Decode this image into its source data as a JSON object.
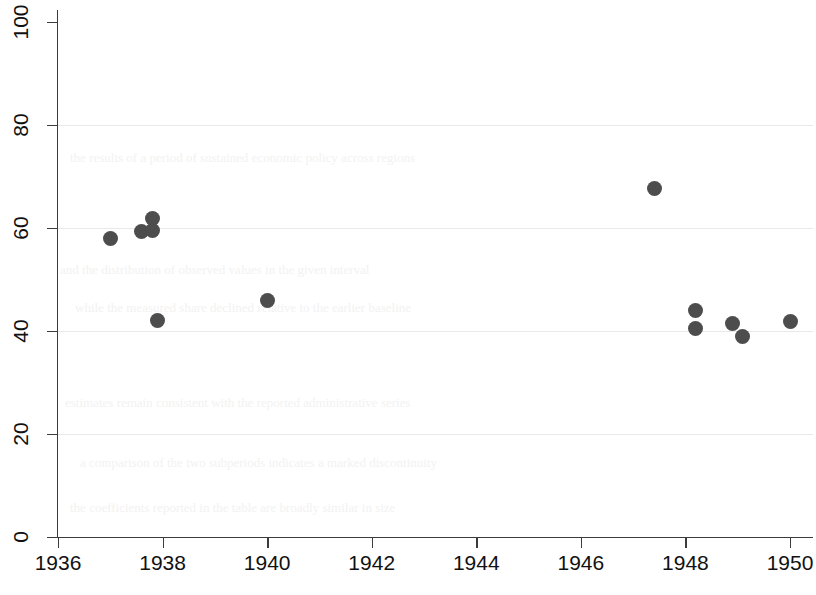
{
  "chart_data": {
    "type": "scatter",
    "title": "",
    "subtitle": "",
    "xlabel": "",
    "ylabel": "",
    "xlim": [
      1935.72,
      1950.72
    ],
    "ylim": [
      0,
      100
    ],
    "grid": "horizontal",
    "legend": "none",
    "marker_color": "#4d4d4d",
    "axis_color": "#3c3c3c",
    "grid_color": "#e9e9e9",
    "background_color": "#ffffff",
    "x_ticks": [
      1936,
      1938,
      1940,
      1942,
      1944,
      1946,
      1948,
      1950
    ],
    "x_tick_labels": [
      "1936",
      "1938",
      "1940",
      "1942",
      "1944",
      "1946",
      "1948",
      "1950"
    ],
    "y_ticks": [
      0,
      20,
      40,
      60,
      80,
      100
    ],
    "y_tick_labels": [
      "0",
      "20",
      "40",
      "60",
      "80",
      "100"
    ],
    "points": [
      {
        "x": 1937.0,
        "y": 58.0
      },
      {
        "x": 1937.6,
        "y": 59.3
      },
      {
        "x": 1937.8,
        "y": 61.8
      },
      {
        "x": 1937.8,
        "y": 59.5
      },
      {
        "x": 1937.9,
        "y": 42.1
      },
      {
        "x": 1940.0,
        "y": 46.0
      },
      {
        "x": 1947.4,
        "y": 67.7
      },
      {
        "x": 1948.2,
        "y": 43.9
      },
      {
        "x": 1948.2,
        "y": 40.4
      },
      {
        "x": 1948.9,
        "y": 41.4
      },
      {
        "x": 1949.1,
        "y": 39.0
      },
      {
        "x": 1950.0,
        "y": 41.8
      }
    ]
  },
  "bleed_text": [
    "the results of a period of sustained economic policy across regions",
    "and the distribution of observed values in the given interval",
    "while the measured share declined relative to the earlier baseline",
    "estimates remain consistent with the reported administrative series",
    "a comparison of the two subperiods indicates a marked discontinuity",
    "the coefficients reported in the table are broadly similar in size"
  ]
}
